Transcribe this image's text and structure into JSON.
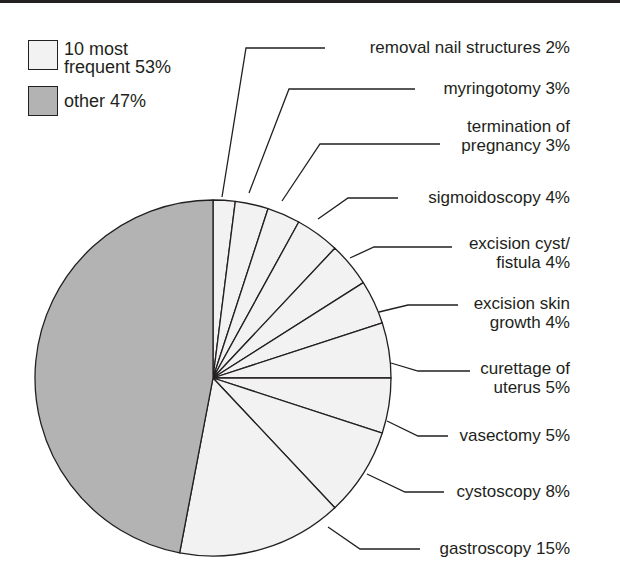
{
  "chart_data": {
    "type": "pie",
    "title": "",
    "legend": [
      {
        "label": "10 most\nfrequent 53%",
        "color": "#f2f2f2"
      },
      {
        "label": "other 47%",
        "color": "#b3b3b3"
      }
    ],
    "slices": [
      {
        "name": "removal nail structures",
        "value": 2,
        "label": "removal nail structures 2%",
        "group": "10 most frequent"
      },
      {
        "name": "myringotomy",
        "value": 3,
        "label": "myringotomy 3%",
        "group": "10 most frequent"
      },
      {
        "name": "termination of pregnancy",
        "value": 3,
        "label": "termination of\npregnancy 3%",
        "group": "10 most frequent"
      },
      {
        "name": "sigmoidoscopy",
        "value": 4,
        "label": "sigmoidoscopy 4%",
        "group": "10 most frequent"
      },
      {
        "name": "excision cyst/fistula",
        "value": 4,
        "label": "excision cyst/\nfistula 4%",
        "group": "10 most frequent"
      },
      {
        "name": "excision skin growth",
        "value": 4,
        "label": "excision skin\ngrowth 4%",
        "group": "10 most frequent"
      },
      {
        "name": "curettage of uterus",
        "value": 5,
        "label": "curettage of\nuterus 5%",
        "group": "10 most frequent"
      },
      {
        "name": "vasectomy",
        "value": 5,
        "label": "vasectomy 5%",
        "group": "10 most frequent"
      },
      {
        "name": "cystoscopy",
        "value": 8,
        "label": "cystoscopy 8%",
        "group": "10 most frequent"
      },
      {
        "name": "gastroscopy",
        "value": 15,
        "label": "gastroscopy 15%",
        "group": "10 most frequent"
      },
      {
        "name": "other",
        "value": 47,
        "label": "other 47%",
        "group": "other"
      }
    ],
    "start_angle": "12 o'clock, clockwise",
    "colors": {
      "frequent": "#f2f2f2",
      "other": "#b3b3b3",
      "stroke": "#231f20"
    }
  },
  "legend": {
    "items": [
      {
        "label": "10 most\nfrequent 53%"
      },
      {
        "label": "other 47%"
      }
    ]
  },
  "labels": [
    "removal nail structures 2%",
    "myringotomy 3%",
    "termination of\npregnancy 3%",
    "sigmoidoscopy 4%",
    "excision cyst/\nfistula 4%",
    "excision skin\ngrowth 4%",
    "curettage of\nuterus 5%",
    "vasectomy 5%",
    "cystoscopy 8%",
    "gastroscopy 15%"
  ]
}
